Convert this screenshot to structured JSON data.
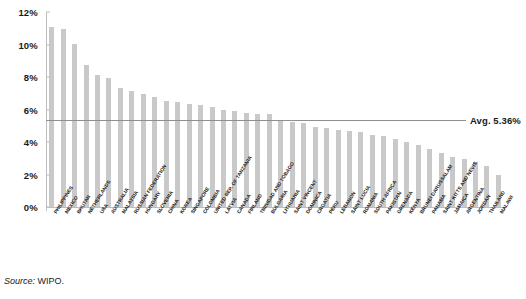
{
  "chart_data": {
    "type": "bar",
    "title": "",
    "subtitle": "",
    "xlabel": "",
    "ylabel": "",
    "ylim": [
      0,
      12
    ],
    "ytick_labels": [
      "0%",
      "2%",
      "4%",
      "6%",
      "8%",
      "10%",
      "12%"
    ],
    "ytick_values": [
      0,
      2,
      4,
      6,
      8,
      10,
      12
    ],
    "grid": false,
    "legend": "none",
    "bar_color": "#c9c9c9",
    "average_line": {
      "label": "Avg. 5.36%",
      "value": 5.36,
      "color": "#8f8f8f"
    },
    "categories": [
      "PHILIPPINES",
      "MEXICO",
      "BHUTAN",
      "NETHERLANDS",
      "USA",
      "AUSTRALIA",
      "MALAYSIA",
      "RUSSIAN FEDERATION",
      "HUNGARY",
      "SLOVENIA",
      "CHINA",
      "KOREA",
      "SINGAPORE",
      "COLOMBIA",
      "UNITED REP. OF TANZANIA",
      "LATVIA",
      "CANADA",
      "FINLAND",
      "TRINIDAD AND TOBAGO",
      "BULGARIA",
      "LITHUANIA",
      "SAINT VINCENT",
      "DOMINICA",
      "CROATIA",
      "PERU",
      "LEBANON",
      "SAINT LUCIA",
      "ROMANIA",
      "SOUTH AFRICA",
      "PAKISTAN",
      "GRENADA",
      "KENYA",
      "BRUNEI DARUSSALAM",
      "PANAMA",
      "SAINT KITTS AND NEVIS",
      "JAMAICA",
      "ARGENTINA",
      "JORDAN",
      "THAILAND",
      "MALAWI"
    ],
    "values": [
      11.1,
      10.95,
      10.05,
      8.75,
      8.1,
      7.95,
      7.35,
      7.15,
      6.95,
      6.8,
      6.55,
      6.45,
      6.35,
      6.25,
      6.15,
      5.95,
      5.9,
      5.8,
      5.75,
      5.7,
      5.3,
      5.25,
      5.2,
      4.95,
      4.85,
      4.75,
      4.7,
      4.6,
      4.45,
      4.35,
      4.2,
      4.0,
      3.8,
      3.6,
      3.35,
      3.1,
      2.95,
      2.75,
      2.55,
      2.0
    ]
  },
  "source": {
    "prefix": "Source:",
    "text": "WIPO."
  }
}
